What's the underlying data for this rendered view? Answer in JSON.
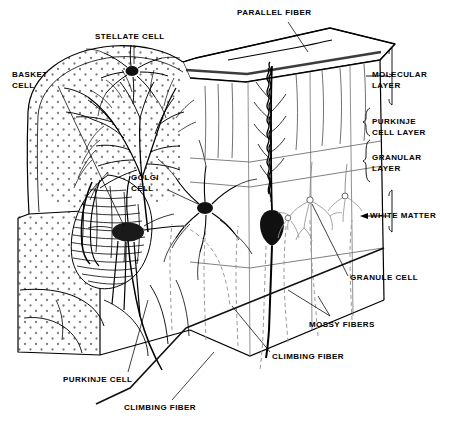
{
  "figure": {
    "ink_color": "#000000",
    "background_color": "#ffffff",
    "stipple_color": "#777777",
    "dashed_fiber_color": "#999999"
  },
  "labels": {
    "parallel_fiber": "PARALLEL FIBER",
    "stellate_cell": "STELLATE CELL",
    "basket_cell": "BASKET\nCELL",
    "golgi_cell": "GÖLGI\nCELL",
    "molecular_layer": "MOLECULAR\nLAYER",
    "purkinje_cell_layer": "PURKINJE\nCELL LAYER",
    "granular_layer": "GRANULAR\nLAYER",
    "white_matter": "WHITE MATTER",
    "granule_cell": "GRANULE CELL",
    "mossy_fibers": "MOSSY FIBERS",
    "climbing_fiber_right": "CLIMBING FIBER",
    "climbing_fiber_bottom": "CLIMBING FIBER",
    "purkinje_cell": "PURKINJE CELL"
  },
  "label_positions": {
    "parallel_fiber": {
      "x": 237,
      "y": 8
    },
    "stellate_cell": {
      "x": 95,
      "y": 32
    },
    "basket_cell": {
      "x": 12,
      "y": 69
    },
    "golgi_cell": {
      "x": 131,
      "y": 172
    },
    "molecular_layer": {
      "x": 372,
      "y": 69
    },
    "purkinje_cell_layer": {
      "x": 372,
      "y": 116
    },
    "granular_layer": {
      "x": 372,
      "y": 152
    },
    "white_matter": {
      "x": 370,
      "y": 211
    },
    "granule_cell": {
      "x": 350,
      "y": 273
    },
    "mossy_fibers": {
      "x": 309,
      "y": 320
    },
    "climbing_fiber_right": {
      "x": 272,
      "y": 352
    },
    "climbing_fiber_bottom": {
      "x": 124,
      "y": 403
    },
    "purkinje_cell": {
      "x": 63,
      "y": 375
    }
  },
  "structures": {
    "layers": [
      {
        "name": "molecular layer",
        "order": 1
      },
      {
        "name": "purkinje cell layer",
        "order": 2
      },
      {
        "name": "granular layer",
        "order": 3
      },
      {
        "name": "white matter",
        "order": 4
      }
    ],
    "cells": [
      "stellate cell",
      "basket cell",
      "golgi cell",
      "purkinje cell",
      "granule cell"
    ],
    "fibers": [
      "parallel fiber",
      "climbing fiber",
      "mossy fibers"
    ]
  }
}
